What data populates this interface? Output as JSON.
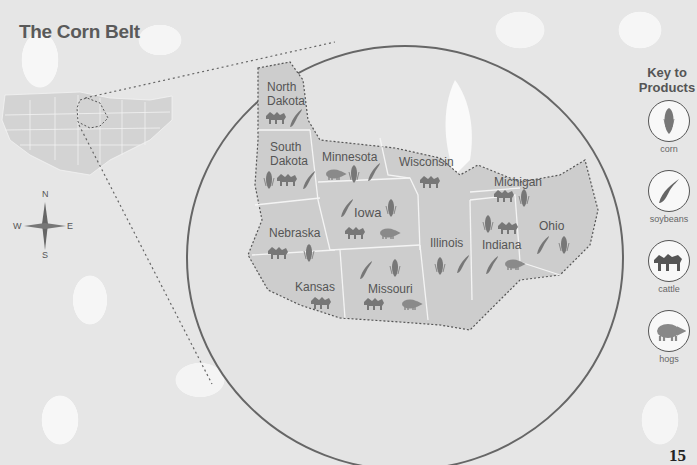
{
  "title": "The Corn Belt",
  "page_number": "15",
  "compass": {
    "n": "N",
    "s": "S",
    "e": "E",
    "w": "W"
  },
  "key": {
    "title_line1": "Key to",
    "title_line2": "Products",
    "items": [
      {
        "icon": "corn-icon",
        "label": "corn"
      },
      {
        "icon": "soybeans-icon",
        "label": "soybeans"
      },
      {
        "icon": "cattle-icon",
        "label": "cattle"
      },
      {
        "icon": "hogs-icon",
        "label": "hogs"
      }
    ]
  },
  "states": [
    {
      "name": "North Dakota",
      "line1": "North",
      "line2": "Dakota",
      "products": [
        "cattle",
        "soybeans"
      ]
    },
    {
      "name": "South Dakota",
      "line1": "South",
      "line2": "Dakota",
      "products": [
        "corn",
        "cattle",
        "soybeans"
      ]
    },
    {
      "name": "Minnesota",
      "line1": "Minnesota",
      "products": [
        "hogs",
        "corn",
        "soybeans"
      ]
    },
    {
      "name": "Wisconsin",
      "line1": "Wisconsin",
      "products": [
        "cattle"
      ]
    },
    {
      "name": "Michigan",
      "line1": "Michigan",
      "products": [
        "cattle",
        "corn"
      ]
    },
    {
      "name": "Nebraska",
      "line1": "Nebraska",
      "products": [
        "cattle",
        "corn"
      ]
    },
    {
      "name": "Iowa",
      "line1": "Iowa",
      "products": [
        "soybeans",
        "corn",
        "cattle",
        "hogs"
      ]
    },
    {
      "name": "Illinois",
      "line1": "Illinois",
      "products": [
        "corn",
        "soybeans"
      ]
    },
    {
      "name": "Indiana",
      "line1": "Indiana",
      "products": [
        "corn",
        "cattle",
        "soybeans",
        "hogs"
      ]
    },
    {
      "name": "Ohio",
      "line1": "Ohio",
      "products": [
        "soybeans",
        "corn"
      ]
    },
    {
      "name": "Kansas",
      "line1": "Kansas",
      "products": [
        "cattle"
      ]
    },
    {
      "name": "Missouri",
      "line1": "Missouri",
      "products": [
        "soybeans",
        "corn",
        "cattle",
        "hogs"
      ]
    }
  ]
}
